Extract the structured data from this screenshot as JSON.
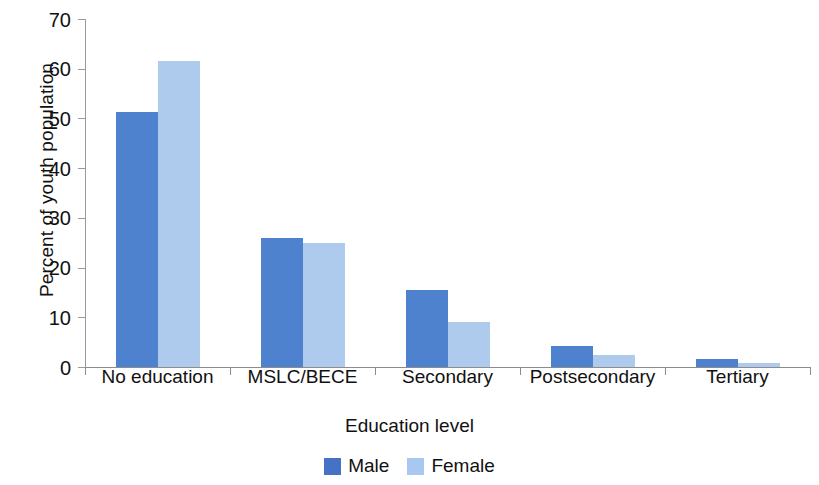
{
  "chart_data": {
    "type": "bar",
    "title": "",
    "subtitle": "",
    "xlabel": "Education level",
    "ylabel": "Percent of youth population",
    "categories": [
      "No education",
      "MSLC/BECE",
      "Secondary",
      "Postsecondary",
      "Tertiary"
    ],
    "series": [
      {
        "name": "Male",
        "color": "#4e82ce",
        "values": [
          51.3,
          26.0,
          15.5,
          4.3,
          1.7
        ]
      },
      {
        "name": "Female",
        "color": "#aecbee",
        "values": [
          61.5,
          24.9,
          9.0,
          2.4,
          0.8
        ]
      }
    ],
    "ylim": [
      0,
      70
    ],
    "ytick_values": [
      0,
      10,
      20,
      30,
      40,
      50,
      60,
      70
    ],
    "ytick_labels": [
      "0",
      "10",
      "20",
      "30",
      "40",
      "50",
      "60",
      "70"
    ],
    "grid": false,
    "legend_position": "bottom",
    "bar_mode": "grouped",
    "annotations": []
  },
  "legend": {
    "items": [
      {
        "label": "Male",
        "swatch": "male-swatch"
      },
      {
        "label": "Female",
        "swatch": "female-swatch"
      }
    ]
  },
  "colors": {
    "male": "#4e82ce",
    "female": "#aecbee",
    "axis": "#8c8c8c",
    "text": "#111111",
    "background": "#ffffff"
  }
}
